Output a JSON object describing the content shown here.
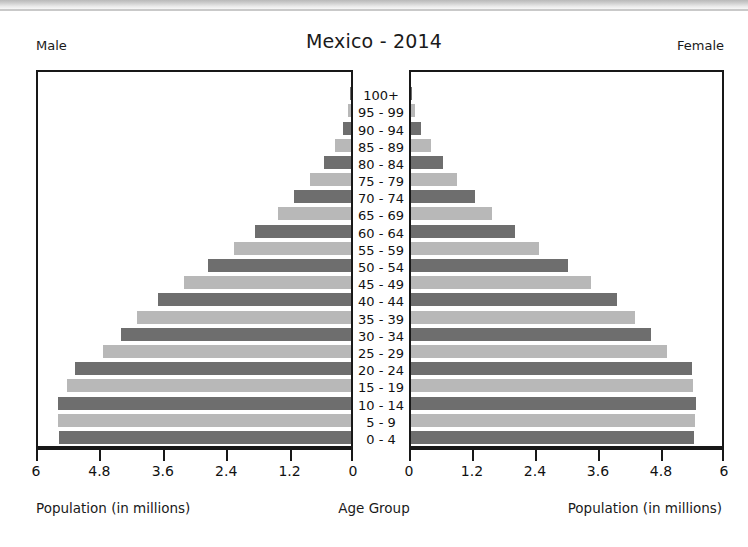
{
  "chart_data": {
    "type": "bar",
    "subtype": "population-pyramid",
    "title": "Mexico - 2014",
    "left_panel_label": "Male",
    "right_panel_label": "Female",
    "xlabel_left": "Population (in millions)",
    "xlabel_center": "Age Group",
    "xlabel_right": "Population (in millions)",
    "ylabel": "Age Group",
    "grid": false,
    "legend_position": "none",
    "xlim_left": [
      6,
      0
    ],
    "xlim_right": [
      0,
      6
    ],
    "x_unit": "millions",
    "xticks_left": [
      "6",
      "4.8",
      "3.6",
      "2.4",
      "1.2",
      "0"
    ],
    "xticks_right": [
      "0",
      "1.2",
      "2.4",
      "3.6",
      "4.8",
      "6"
    ],
    "xtick_values_left": [
      6,
      4.8,
      3.6,
      2.4,
      1.2,
      0
    ],
    "xtick_values_right": [
      0,
      1.2,
      2.4,
      3.6,
      4.8,
      6
    ],
    "categories": [
      "0 - 4",
      "5 - 9",
      "10 - 14",
      "15 - 19",
      "20 - 24",
      "25 - 29",
      "30 - 34",
      "35 - 39",
      "40 - 44",
      "45 - 49",
      "50 - 54",
      "55 - 59",
      "60 - 64",
      "65 - 69",
      "70 - 74",
      "75 - 79",
      "80 - 84",
      "85 - 89",
      "90 - 94",
      "95 - 99",
      "100+"
    ],
    "series": [
      {
        "name": "Male",
        "side": "left",
        "values": [
          5.6,
          5.62,
          5.62,
          5.45,
          5.3,
          4.75,
          4.4,
          4.1,
          3.7,
          3.2,
          2.75,
          2.25,
          1.85,
          1.4,
          1.1,
          0.78,
          0.52,
          0.3,
          0.16,
          0.06,
          0.02
        ]
      },
      {
        "name": "Female",
        "side": "right",
        "values": [
          5.42,
          5.44,
          5.46,
          5.4,
          5.38,
          4.9,
          4.6,
          4.3,
          3.95,
          3.45,
          3.0,
          2.45,
          2.0,
          1.55,
          1.22,
          0.88,
          0.62,
          0.38,
          0.2,
          0.07,
          0.02
        ]
      }
    ],
    "colors": {
      "bar_dark": "#6e6e6e",
      "bar_light": "#b8b8b8",
      "axis": "#181818",
      "text": "#111111",
      "background": "#ffffff"
    }
  }
}
